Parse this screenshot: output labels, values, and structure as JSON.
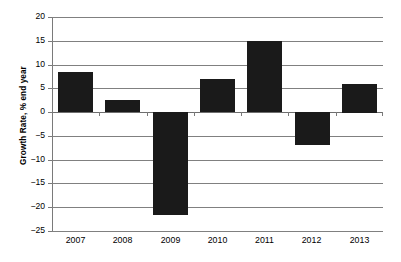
{
  "chart_data": {
    "type": "bar",
    "title": "",
    "subtitle": "",
    "xlabel": "",
    "ylabel": "Growth Rate, % end year",
    "categories": [
      "2007",
      "2008",
      "2009",
      "2010",
      "2011",
      "2012",
      "2013"
    ],
    "values": [
      8.5,
      2.6,
      -21.7,
      7.0,
      15.0,
      -6.9,
      6.0
    ],
    "series": [
      {
        "name": "Growth Rate",
        "values": [
          8.5,
          2.6,
          -21.7,
          7.0,
          15.0,
          -6.9,
          6.0
        ]
      }
    ],
    "ylim": [
      -25,
      20
    ],
    "ytick_values": [
      20,
      15,
      10,
      5,
      0,
      -5,
      -10,
      -15,
      -20,
      -25
    ],
    "ytick_labels": [
      "20",
      "15",
      "10",
      "5",
      "0",
      "−5",
      "−10",
      "−15",
      "−20",
      "−25"
    ],
    "grid": true,
    "grid_axis": "y",
    "legend": false,
    "legend_position": "none",
    "bar_color": "#1a1a1a",
    "grid_color": "#808080",
    "axis_color": "#7a7a7a",
    "background_color": "#ffffff",
    "annotations": []
  }
}
